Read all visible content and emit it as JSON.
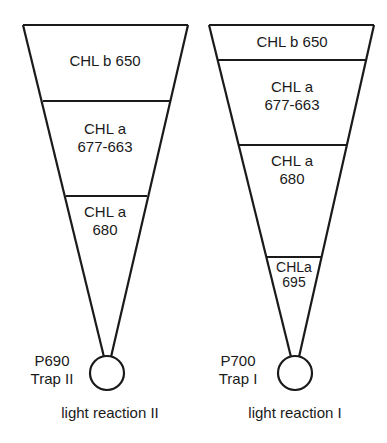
{
  "diagram": {
    "funnels": [
      {
        "id": "left",
        "layers": [
          {
            "line1": "CHL b 650",
            "line2": ""
          },
          {
            "line1": "CHL a",
            "line2": "677-663"
          },
          {
            "line1": "CHL a",
            "line2": "680"
          }
        ],
        "trap": {
          "line1": "P690",
          "line2": "Trap II"
        },
        "caption": "light reaction II"
      },
      {
        "id": "right",
        "layers": [
          {
            "line1": "CHL b 650",
            "line2": ""
          },
          {
            "line1": "CHL a",
            "line2": "677-663"
          },
          {
            "line1": "CHL a",
            "line2": "680"
          },
          {
            "line1": "CHLa",
            "line2": "695"
          }
        ],
        "trap": {
          "line1": "P700",
          "line2": "Trap I"
        },
        "caption": "light reaction I"
      }
    ],
    "colors": {
      "stroke": "#1a1a1a",
      "background": "#ffffff"
    }
  }
}
